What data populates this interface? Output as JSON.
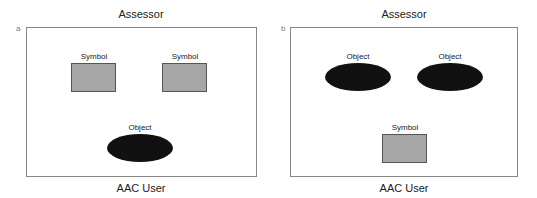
{
  "panels": [
    {
      "label": "a",
      "top_title": "Assessor",
      "bottom_title": "AAC User",
      "items": [
        {
          "type": "symbol",
          "label": "Symbol"
        },
        {
          "type": "symbol",
          "label": "Symbol"
        },
        {
          "type": "object",
          "label": "Object"
        }
      ]
    },
    {
      "label": "b",
      "top_title": "Assessor",
      "bottom_title": "AAC User",
      "items": [
        {
          "type": "object",
          "label": "Object"
        },
        {
          "type": "object",
          "label": "Object"
        },
        {
          "type": "symbol",
          "label": "Symbol"
        }
      ]
    }
  ],
  "colors": {
    "symbol_fill": "#a6a6a6",
    "object_fill": "#111111",
    "frame": "#888888"
  }
}
